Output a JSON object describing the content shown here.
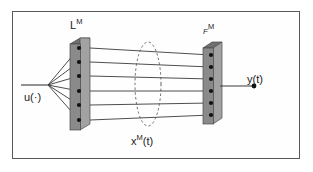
{
  "figure": {
    "type": "block-diagram",
    "frame": {
      "border_color": "#58585a",
      "background": "#fefefe"
    },
    "colors": {
      "slab_face": "#8a8a8a",
      "slab_top": "#6f6f6f",
      "slab_side": "#a2a2a2",
      "node": "#111111",
      "line": "#3a3a3a",
      "ellipse_dash": "#555555",
      "text": "#1b1b1b"
    },
    "labels": {
      "input": {
        "name": "u",
        "arg": "(·)",
        "text": "u(·)"
      },
      "left_block": {
        "base": "L",
        "sup": "M",
        "text": "L"
      },
      "right_block": {
        "base": "F",
        "sup": "M",
        "text": "F"
      },
      "state": {
        "base": "x",
        "sup": "M",
        "arg": "(t)",
        "text": "x"
      },
      "output": {
        "base": "y",
        "arg": "(t)",
        "text": "y(t)"
      }
    },
    "left_block": {
      "name": "L-M-slab",
      "node_count": 6,
      "nodes_y": [
        48,
        62,
        76,
        91,
        105,
        120
      ]
    },
    "right_block": {
      "name": "F-M-slab",
      "node_count": 6,
      "nodes_y": [
        55,
        67,
        79,
        91,
        103,
        115
      ]
    },
    "state_ellipse": {
      "name": "x-M-state-ellipse",
      "cx": 148,
      "cy": 84,
      "rx": 13,
      "ry": 42,
      "dashed": true
    },
    "input_fan": {
      "origin_x": 48,
      "origin_y": 85,
      "line_count": 6
    },
    "connections": {
      "count": 6
    },
    "output_terminal": {
      "x": 254,
      "y": 86
    }
  }
}
